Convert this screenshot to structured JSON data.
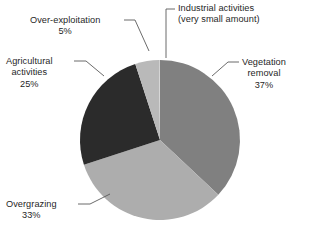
{
  "figure": {
    "clipped_heading_remnant": "",
    "background_color": "#ffffff",
    "text_color": "#1f1f1f",
    "leader_line_color": "#5a5a5a"
  },
  "chart_data": {
    "type": "pie",
    "title": "",
    "subtitle": "",
    "xlabel": "",
    "ylabel": "",
    "legend_position": "callout-labels",
    "grid": false,
    "start_angle_deg": 0,
    "direction": "clockwise",
    "categories": [
      "Vegetation removal",
      "Overgrazing",
      "Agricultural activities",
      "Over-exploitation",
      "Industrial activities"
    ],
    "values": [
      37,
      33,
      25,
      5,
      0
    ],
    "value_labels": [
      "37%",
      "33%",
      "25%",
      "5%",
      "(very small amount)"
    ],
    "colors": [
      "#808080",
      "#adadad",
      "#2b2b2b",
      "#b9b9b9",
      "#cfcfcf"
    ],
    "slices": [
      {
        "name": "vegetation-removal",
        "label_line1": "Vegetation",
        "label_line2": "removal",
        "value": 37,
        "value_label": "37%",
        "color": "#808080",
        "start_deg": 0,
        "end_deg": 133.2
      },
      {
        "name": "overgrazing",
        "label_line1": "Overgrazing",
        "label_line2": "",
        "value": 33,
        "value_label": "33%",
        "color": "#adadad",
        "start_deg": 133.2,
        "end_deg": 252.0
      },
      {
        "name": "agricultural-activities",
        "label_line1": "Agricultural",
        "label_line2": "activities",
        "value": 25,
        "value_label": "25%",
        "color": "#2b2b2b",
        "start_deg": 252.0,
        "end_deg": 342.0
      },
      {
        "name": "over-exploitation",
        "label_line1": "Over-exploitation",
        "label_line2": "",
        "value": 5,
        "value_label": "5%",
        "color": "#b9b9b9",
        "start_deg": 342.0,
        "end_deg": 359.3
      },
      {
        "name": "industrial-activities",
        "label_line1": "Industrial activities",
        "label_line2": "(very small amount)",
        "value": 0,
        "value_label": "(very small amount)",
        "color": "#cfcfcf",
        "start_deg": 359.3,
        "end_deg": 360.0
      }
    ]
  }
}
